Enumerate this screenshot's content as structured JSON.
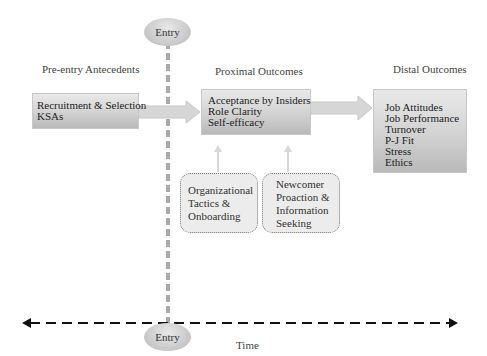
{
  "headers": {
    "pre_entry": "Pre-entry Antecedents",
    "proximal": "Proximal Outcomes",
    "distal": "Distal Outcomes"
  },
  "entry_label_top": "Entry",
  "entry_label_bottom": "Entry",
  "boxes": {
    "pre_entry": [
      "Recruitment & Selection",
      "KSAs"
    ],
    "proximal": [
      "Acceptance by Insiders",
      "Role Clarity",
      "Self-efficacy"
    ],
    "distal": [
      "Job Attitudes",
      "Job Performance",
      "Turnover",
      "P-J Fit",
      "Stress",
      "Ethics"
    ],
    "org_tactics": [
      "Organizational",
      "Tactics &",
      "Onboarding"
    ],
    "newcomer": [
      "Newcomer",
      "Proaction &",
      "Information",
      "Seeking"
    ]
  },
  "time_label": "Time"
}
